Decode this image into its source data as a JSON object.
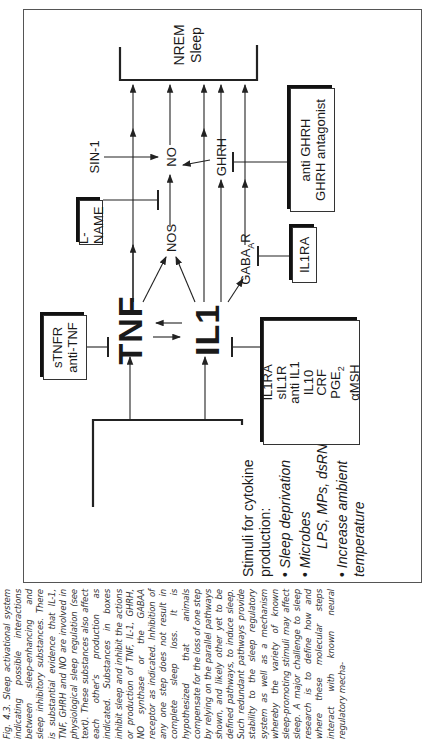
{
  "figure": {
    "caption": {
      "label": "Fig. 4.3.",
      "text": "Sleep activational system indicating possible interactions between sleep-enhancing and sleep inhibitory substances. There is substantial evidence that IL-1, TNF, GHRH and NO are involved in physiological sleep regulation (see text). These substances also affect each other's production as indicated. Substances in boxes inhibit sleep and inhibit the actions or production of TNF, IL-1, GHRH, NO synthase or the GABAA receptor as indicated. Inhibition of any one step does not result in complete sleep loss. It is hypothesized that animals compensate for the loss of one step by relying on the parallel pathways shown, and likely other yet to be defined pathways, to induce sleep. Such redundant pathways provide stability to the sleep regulatory system as well as a mechanism whereby the variety of known sleep-promoting stimuli may affect sleep. A major challenge to sleep research is to define how and where these molecular steps interact with known neural regulatory mecha-"
    },
    "diagram": {
      "stimuli": {
        "title": "Stimuli for cytokine production:",
        "items": [
          "Sleep deprivation",
          "Microbes",
          "LPS, MPs, dsRNA",
          "Increase ambient temperature"
        ]
      },
      "nodes": {
        "tnf": "TNF",
        "il1": "IL1",
        "nos": "NOS",
        "no": "NO",
        "ghrh": "GHRH",
        "gaba": "GABA",
        "gaba_sub": "A",
        "gaba_suffix": "R",
        "sin1": "SIN-1",
        "outcome_line1": "NREM",
        "outcome_line2": "Sleep"
      },
      "inhibitor_boxes": {
        "tnf_box": [
          "sTNFR",
          "anti-TNF"
        ],
        "lname_box": [
          "L-NAME"
        ],
        "il1ra_box": [
          "IL1RA"
        ],
        "ghrh_box": [
          "anti GHRH",
          "GHRH antagonist"
        ],
        "il1_box": [
          "IL1RA",
          "sIL1R",
          "anti IL1",
          "IL10",
          "CRF",
          "PGE",
          "αMSH"
        ],
        "pge_sub": "2"
      }
    }
  }
}
